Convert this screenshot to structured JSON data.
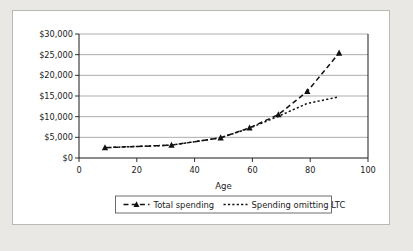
{
  "chart_data": {
    "type": "line",
    "title": "",
    "xlabel": "Age",
    "ylabel": "",
    "xlim": [
      0,
      100
    ],
    "ylim": [
      0,
      30000
    ],
    "grid": true,
    "legend_position": "bottom",
    "x_ticks": [
      "0",
      "20",
      "40",
      "60",
      "80",
      "100"
    ],
    "x_tick_values": [
      0,
      20,
      40,
      60,
      80,
      100
    ],
    "y_ticks": [
      "$0",
      "$5,000",
      "$10,000",
      "$15,000",
      "$20,000",
      "$25,000",
      "$30,000"
    ],
    "y_tick_values": [
      0,
      5000,
      10000,
      15000,
      20000,
      25000,
      30000
    ],
    "series": [
      {
        "name": "Total spending",
        "marker": "triangle",
        "linestyle": "dashed",
        "x": [
          9,
          32,
          49,
          59,
          69,
          79,
          90
        ],
        "values": [
          2500,
          3100,
          4900,
          7300,
          10500,
          16100,
          25400
        ]
      },
      {
        "name": "Spending omitting LTC",
        "marker": "none",
        "linestyle": "dotted",
        "x": [
          9,
          32,
          49,
          59,
          69,
          79,
          90
        ],
        "values": [
          2500,
          3100,
          4900,
          7200,
          10100,
          13200,
          14800
        ]
      }
    ]
  },
  "axis": {
    "x_title": "Age"
  },
  "legend": {
    "items": [
      {
        "label": "Total spending"
      },
      {
        "label": "Spending omitting LTC"
      }
    ]
  }
}
